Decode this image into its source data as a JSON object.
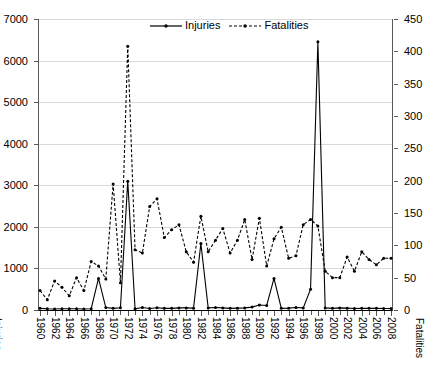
{
  "chart_data": {
    "type": "line",
    "title": "",
    "xlabel": "",
    "ylabel": "Injuries",
    "y2label": "Fatalities",
    "grid": true,
    "legend_position": "top-center",
    "ylim": [
      0,
      7000
    ],
    "y2lim": [
      0,
      450
    ],
    "yticks": [
      0,
      1000,
      2000,
      3000,
      4000,
      5000,
      6000,
      7000
    ],
    "y2ticks": [
      0,
      50,
      100,
      150,
      200,
      250,
      300,
      350,
      400,
      450
    ],
    "x": [
      1960,
      1961,
      1962,
      1963,
      1964,
      1965,
      1966,
      1967,
      1968,
      1969,
      1970,
      1971,
      1972,
      1973,
      1974,
      1975,
      1976,
      1977,
      1978,
      1979,
      1980,
      1981,
      1982,
      1983,
      1984,
      1985,
      1986,
      1987,
      1988,
      1989,
      1990,
      1991,
      1992,
      1993,
      1994,
      1995,
      1996,
      1997,
      1998,
      1999,
      2000,
      2001,
      2002,
      2003,
      2004,
      2005,
      2006,
      2007,
      2008
    ],
    "xtick_labels": [
      "1960",
      "1962",
      "1964",
      "1966",
      "1968",
      "1970",
      "1972",
      "1974",
      "1976",
      "1978",
      "1980",
      "1982",
      "1984",
      "1986",
      "1988",
      "1990",
      "1992",
      "1994",
      "1996",
      "1998",
      "2000",
      "2002",
      "2004",
      "2006",
      "2008"
    ],
    "series": [
      {
        "name": "Injuries",
        "axis": "left",
        "line_style": "solid",
        "marker": "circle",
        "color": "#000000",
        "values": [
          40,
          30,
          25,
          30,
          30,
          30,
          25,
          30,
          760,
          60,
          40,
          55,
          3100,
          30,
          60,
          35,
          55,
          40,
          40,
          50,
          50,
          45,
          1600,
          50,
          60,
          50,
          40,
          45,
          50,
          70,
          120,
          110,
          760,
          40,
          45,
          60,
          50,
          500,
          6450,
          50,
          40,
          50,
          45,
          35,
          40,
          40,
          40,
          35,
          35
        ]
      },
      {
        "name": "Fatalities",
        "axis": "right",
        "line_style": "dashed",
        "marker": "circle",
        "color": "#000000",
        "values": [
          30,
          16,
          45,
          35,
          22,
          50,
          30,
          75,
          68,
          48,
          195,
          42,
          408,
          93,
          88,
          160,
          172,
          112,
          124,
          132,
          90,
          74,
          145,
          90,
          108,
          126,
          88,
          108,
          140,
          78,
          142,
          68,
          110,
          128,
          80,
          84,
          132,
          140,
          130,
          60,
          50,
          50,
          82,
          60,
          90,
          78,
          70,
          80,
          80
        ]
      }
    ]
  },
  "legend": {
    "entries": [
      {
        "label": "Injuries",
        "style": "solid"
      },
      {
        "label": "Fatalities",
        "style": "dashed"
      }
    ]
  },
  "axis_titles": {
    "left": "Injuries",
    "right": "Fatalities"
  }
}
